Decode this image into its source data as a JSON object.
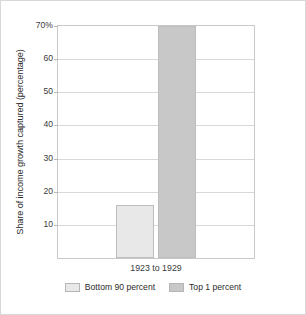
{
  "chart_data": {
    "type": "bar",
    "title": "",
    "xlabel": "",
    "ylabel": "Share of income growth captured (percentage)",
    "categories": [
      "1923 to 1929"
    ],
    "ylim": [
      0,
      70
    ],
    "grid": true,
    "legend_position": "bottom",
    "ytick_labels": [
      "70%",
      "60",
      "50",
      "40",
      "30",
      "20",
      "10"
    ],
    "ytick_values": [
      70,
      60,
      50,
      40,
      30,
      20,
      10
    ],
    "series": [
      {
        "name": "Bottom 90 percent",
        "values": [
          16
        ],
        "color": "#e8e8e8"
      },
      {
        "name": "Top 1 percent",
        "values": [
          70
        ],
        "color": "#c8c8c8"
      }
    ]
  },
  "colors": {
    "series_light": "#e8e8e8",
    "series_dark": "#c8c8c8",
    "bar_stroke": "#bdbdbd",
    "gridline": "#d9d9d9",
    "plot_border": "#c9c9c9",
    "figure_border": "#d8d8d8",
    "text": "#2b2b2b"
  }
}
